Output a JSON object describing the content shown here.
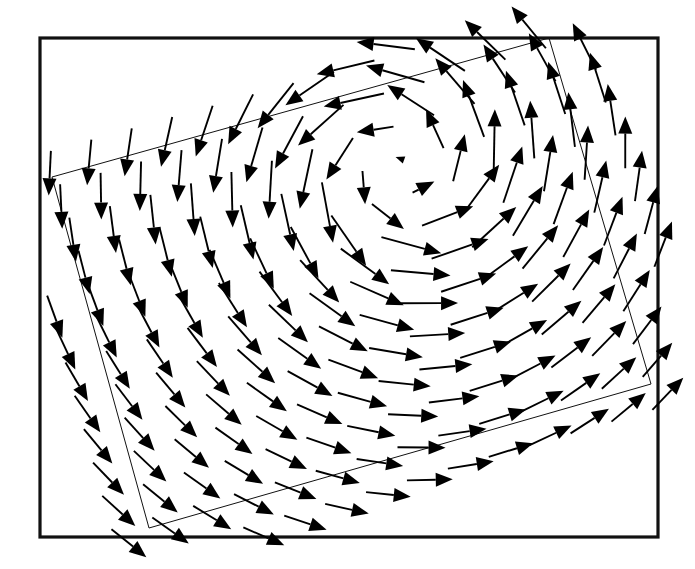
{
  "figure": {
    "type": "vector-field-plot",
    "title": "",
    "background_color": "#ffffff",
    "ink_color": "#000000",
    "frame": {
      "x": 40,
      "y": 38,
      "width": 618,
      "height": 499,
      "stroke_width": 3.2,
      "color": "#111111"
    },
    "domain_outline": {
      "label": "rotated computational grid boundary",
      "stroke_width": 1.0,
      "color": "#111111",
      "corners": [
        {
          "name": "top-left",
          "x": 52,
          "y": 177
        },
        {
          "name": "top-right",
          "x": 549,
          "y": 38
        },
        {
          "name": "bottom-right",
          "x": 651,
          "y": 384
        },
        {
          "name": "bottom-left",
          "x": 149,
          "y": 528
        }
      ]
    }
  },
  "chart_data": {
    "type": "scatter",
    "subtype": "quiver",
    "title": "",
    "xlabel": "",
    "ylabel": "",
    "grid": false,
    "legend": null,
    "ticks": {
      "x": [],
      "y": []
    },
    "field": {
      "model": "solid-body-like vortex with radial decay",
      "rotation": "counter-clockwise",
      "vortex_center": {
        "x": 400,
        "y": 168
      },
      "core_radius": 70,
      "peak_speed_px": 62,
      "decay_radius": 330
    },
    "mesh": {
      "columns": 14,
      "rows": 12,
      "u_range": [
        -0.07,
        1.07
      ],
      "v_range": [
        -0.07,
        1.07
      ],
      "corner_p00": {
        "x": 52,
        "y": 177
      },
      "corner_p10": {
        "x": 549,
        "y": 38
      },
      "corner_p11": {
        "x": 651,
        "y": 384
      },
      "corner_p01": {
        "x": 149,
        "y": 528
      }
    },
    "arrow_style": {
      "shaft_width": 1.9,
      "head_length": 17,
      "head_half_width": 7.0,
      "min_head_length": 9,
      "scale": 1.0
    },
    "series": [
      {
        "name": "velocity",
        "units": "px",
        "note": "u = -omega*(y - yc), v = omega*(x - xc) scaled by radial profile"
      }
    ]
  }
}
